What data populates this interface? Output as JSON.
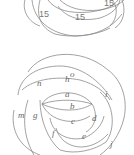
{
  "top_figure": {
    "numbers": [
      "15",
      "15",
      "15"
    ]
  },
  "bottom_figure": {
    "region_labels": {
      "o": "o",
      "n": "n",
      "h": "h",
      "i": "i",
      "a": "a",
      "b": "b",
      "m": "m",
      "g": "g",
      "c": "c",
      "d": "d",
      "f": "f",
      "e": "e",
      "j": "j"
    }
  }
}
